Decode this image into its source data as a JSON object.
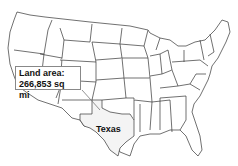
{
  "map": {
    "title": "Contiguous United States",
    "highlighted_state": "Texas",
    "callout": {
      "line1": "Land area:",
      "line2": "266,853 sq mi"
    },
    "state_label": "Texas",
    "colors": {
      "stroke": "#333333",
      "fill": "#ffffff",
      "callout_border": "#888888"
    }
  }
}
